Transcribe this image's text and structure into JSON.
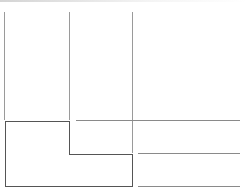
{
  "canvas": {
    "background": "#ffffff",
    "line_color": "#9a9a9a",
    "shape_border_color": "#555555"
  },
  "columns": [
    {
      "name": "column-divider-left",
      "x": 4,
      "top": 12,
      "bottom": 120
    },
    {
      "name": "column-divider-middle",
      "x": 69,
      "top": 12,
      "bottom": 120
    },
    {
      "name": "column-divider-right",
      "x": 132,
      "top": 12,
      "bottom": 153
    }
  ],
  "rows": [
    {
      "name": "row-line-1",
      "y": 120,
      "left": 76,
      "right": 240
    },
    {
      "name": "row-line-2",
      "y": 153,
      "left": 138,
      "right": 240
    },
    {
      "name": "row-line-3",
      "y": 186,
      "left": 138,
      "right": 240
    }
  ]
}
